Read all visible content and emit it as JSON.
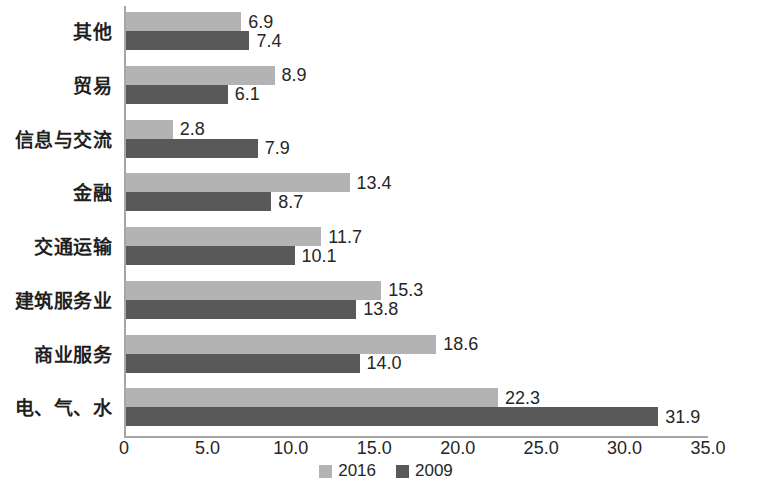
{
  "chart_data": {
    "type": "bar",
    "orientation": "horizontal",
    "title": "",
    "subtitle": "",
    "xlabel": "",
    "ylabel": "",
    "xlim": [
      0,
      35
    ],
    "xticks": [
      "0",
      "5.0",
      "10.0",
      "15.0",
      "20.0",
      "25.0",
      "30.0",
      "35.0"
    ],
    "xtick_values": [
      0,
      5,
      10,
      15,
      20,
      25,
      30,
      35
    ],
    "grid": false,
    "legend_position": "bottom",
    "categories": [
      "其他",
      "贸易",
      "信息与交流",
      "金融",
      "交通运输",
      "建筑服务业",
      "商业服务",
      "电、气、水"
    ],
    "series": [
      {
        "name": "2016",
        "color": "#b3b3b3",
        "values": [
          6.9,
          8.9,
          2.8,
          13.4,
          11.7,
          15.3,
          18.6,
          22.3
        ],
        "labels": [
          "6.9",
          "8.9",
          "2.8",
          "13.4",
          "11.7",
          "15.3",
          "18.6",
          "22.3"
        ]
      },
      {
        "name": "2009",
        "color": "#595959",
        "values": [
          7.4,
          6.1,
          7.9,
          8.7,
          10.1,
          13.8,
          14.0,
          31.9
        ],
        "labels": [
          "7.4",
          "6.1",
          "7.9",
          "8.7",
          "10.1",
          "13.8",
          "14.0",
          "31.9"
        ]
      }
    ]
  },
  "legend": {
    "items": [
      {
        "label": "2016",
        "color": "#b3b3b3"
      },
      {
        "label": "2009",
        "color": "#595959"
      }
    ]
  },
  "colors": {
    "series_2016": "#b3b3b3",
    "series_2009": "#595959",
    "axis": "#a6a6a6",
    "text": "#262626",
    "background": "#ffffff"
  }
}
